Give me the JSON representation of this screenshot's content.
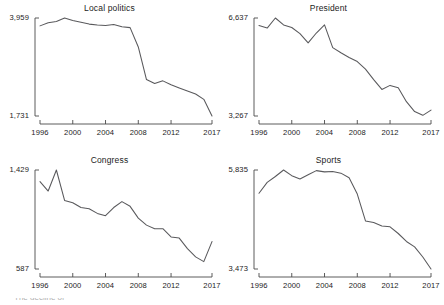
{
  "figure": {
    "type": "small-multiples-line-grid",
    "rows": 2,
    "cols": 2,
    "caption_fragment": "The decline of"
  },
  "axis": {
    "x_ticks": [
      "1996",
      "2000",
      "2004",
      "2008",
      "2012",
      "2017"
    ],
    "x_tick_values": [
      1996,
      2000,
      2004,
      2008,
      2012,
      2017
    ],
    "x_range": [
      1996,
      2017
    ]
  },
  "panels": [
    {
      "key": "local_politics",
      "title": "Local politics",
      "y_min_label": "1,731",
      "y_max_label": "3,959"
    },
    {
      "key": "president",
      "title": "President",
      "y_min_label": "3,267",
      "y_max_label": "6,637"
    },
    {
      "key": "congress",
      "title": "Congress",
      "y_min_label": "587",
      "y_max_label": "1,429"
    },
    {
      "key": "sports",
      "title": "Sports",
      "y_min_label": "3,473",
      "y_max_label": "5,835"
    }
  ],
  "chart_data": [
    {
      "type": "line",
      "title": "Local politics",
      "xlabel": "",
      "ylabel": "",
      "xlim": [
        1996,
        2017
      ],
      "ylim": [
        1731,
        3959
      ],
      "grid": false,
      "legend": "none",
      "x": [
        1996,
        1997,
        1998,
        1999,
        2000,
        2001,
        2002,
        2003,
        2004,
        2005,
        2006,
        2007,
        2008,
        2009,
        2010,
        2011,
        2012,
        2013,
        2014,
        2015,
        2016,
        2017
      ],
      "values": [
        3780,
        3850,
        3880,
        3959,
        3900,
        3860,
        3820,
        3800,
        3790,
        3810,
        3760,
        3740,
        3300,
        2560,
        2470,
        2530,
        2440,
        2370,
        2300,
        2230,
        2110,
        1731
      ]
    },
    {
      "type": "line",
      "title": "President",
      "xlabel": "",
      "ylabel": "",
      "xlim": [
        1996,
        2017
      ],
      "ylim": [
        3267,
        6637
      ],
      "grid": false,
      "legend": "none",
      "x": [
        1996,
        1997,
        1998,
        1999,
        2000,
        2001,
        2002,
        2003,
        2004,
        2005,
        2006,
        2007,
        2008,
        2009,
        2010,
        2011,
        2012,
        2013,
        2014,
        2015,
        2016,
        2017
      ],
      "values": [
        6380,
        6290,
        6637,
        6400,
        6310,
        6100,
        5780,
        6120,
        6400,
        5620,
        5440,
        5280,
        5140,
        4880,
        4520,
        4180,
        4320,
        4240,
        3760,
        3420,
        3290,
        3470
      ]
    },
    {
      "type": "line",
      "title": "Congress",
      "xlabel": "",
      "ylabel": "",
      "xlim": [
        1996,
        2017
      ],
      "ylim": [
        587,
        1429
      ],
      "grid": false,
      "legend": "none",
      "x": [
        1996,
        1997,
        1998,
        1999,
        2000,
        2001,
        2002,
        2003,
        2004,
        2005,
        2006,
        2007,
        2008,
        2009,
        2010,
        2011,
        2012,
        2013,
        2014,
        2015,
        2016,
        2017
      ],
      "values": [
        1330,
        1250,
        1429,
        1170,
        1150,
        1110,
        1100,
        1060,
        1040,
        1110,
        1160,
        1120,
        1020,
        960,
        930,
        930,
        860,
        850,
        760,
        690,
        650,
        820
      ]
    },
    {
      "type": "line",
      "title": "Sports",
      "xlabel": "",
      "ylabel": "",
      "xlim": [
        1996,
        2017
      ],
      "ylim": [
        3473,
        5835
      ],
      "grid": false,
      "legend": "none",
      "x": [
        1996,
        1997,
        1998,
        1999,
        2000,
        2001,
        2002,
        2003,
        2004,
        2005,
        2006,
        2007,
        2008,
        2009,
        2010,
        2011,
        2012,
        2013,
        2014,
        2015,
        2016,
        2017
      ],
      "values": [
        5280,
        5540,
        5680,
        5835,
        5700,
        5620,
        5720,
        5820,
        5790,
        5800,
        5760,
        5650,
        5260,
        4620,
        4580,
        4500,
        4480,
        4320,
        4130,
        4000,
        3760,
        3473
      ]
    }
  ]
}
